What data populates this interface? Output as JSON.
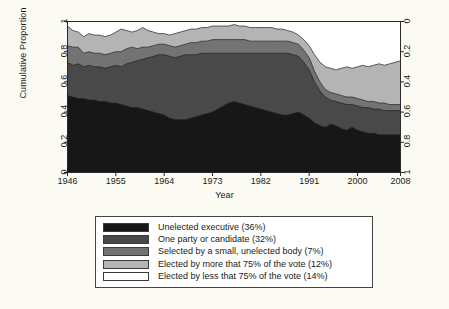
{
  "chart_data": {
    "type": "area",
    "title": "",
    "subtitle": "",
    "xlabel": "Year",
    "ylabel": "Cumulative Proportion",
    "ylabel_right": "",
    "xlim": [
      1946,
      2008
    ],
    "ylim": [
      0,
      1
    ],
    "xticks": [
      1946,
      1955,
      1964,
      1973,
      1982,
      1991,
      2000,
      2008
    ],
    "xtick_labels": [
      "1946",
      "1955",
      "1964",
      "1973",
      "1982",
      "1991",
      "2000",
      "2008"
    ],
    "yticks_left": [
      0,
      0.2,
      0.4,
      0.6,
      0.8,
      1
    ],
    "ytick_labels_left": [
      "0",
      "0.2",
      "0.4",
      "0.6",
      "0.8",
      "1"
    ],
    "yticks_right": [
      0,
      0.2,
      0.4,
      0.6,
      0.8,
      1
    ],
    "ytick_labels_right": [
      "0",
      "0.2",
      "0.4",
      "0.6",
      "0.8",
      "1"
    ],
    "right_axis_inverted": true,
    "grid": false,
    "legend_position": "below-plot",
    "stacked": true,
    "x": [
      1946,
      1947,
      1948,
      1949,
      1950,
      1951,
      1952,
      1953,
      1954,
      1955,
      1956,
      1957,
      1958,
      1959,
      1960,
      1961,
      1962,
      1963,
      1964,
      1965,
      1966,
      1967,
      1968,
      1969,
      1970,
      1971,
      1972,
      1973,
      1974,
      1975,
      1976,
      1977,
      1978,
      1979,
      1980,
      1981,
      1982,
      1983,
      1984,
      1985,
      1986,
      1987,
      1988,
      1989,
      1990,
      1991,
      1992,
      1993,
      1994,
      1995,
      1996,
      1997,
      1998,
      1999,
      2000,
      2001,
      2002,
      2003,
      2004,
      2005,
      2006,
      2007,
      2008
    ],
    "series": [
      {
        "name": "Unelected executive (36%)",
        "color": "#171717",
        "share_overall": 36,
        "cumulative_top": [
          0.51,
          0.5,
          0.49,
          0.49,
          0.48,
          0.48,
          0.47,
          0.47,
          0.46,
          0.46,
          0.45,
          0.44,
          0.43,
          0.43,
          0.42,
          0.41,
          0.4,
          0.39,
          0.38,
          0.36,
          0.35,
          0.35,
          0.35,
          0.36,
          0.37,
          0.38,
          0.39,
          0.4,
          0.42,
          0.44,
          0.46,
          0.47,
          0.46,
          0.45,
          0.44,
          0.43,
          0.42,
          0.41,
          0.4,
          0.39,
          0.38,
          0.38,
          0.39,
          0.4,
          0.38,
          0.36,
          0.33,
          0.31,
          0.3,
          0.32,
          0.31,
          0.29,
          0.28,
          0.3,
          0.28,
          0.27,
          0.26,
          0.26,
          0.25,
          0.25,
          0.25,
          0.25,
          0.25
        ]
      },
      {
        "name": "One party or candidate (32%)",
        "color": "#494949",
        "share_overall": 32,
        "cumulative_top": [
          0.73,
          0.71,
          0.72,
          0.7,
          0.71,
          0.7,
          0.7,
          0.69,
          0.7,
          0.71,
          0.7,
          0.72,
          0.73,
          0.74,
          0.75,
          0.76,
          0.77,
          0.78,
          0.78,
          0.77,
          0.76,
          0.77,
          0.78,
          0.78,
          0.78,
          0.79,
          0.79,
          0.79,
          0.79,
          0.79,
          0.79,
          0.79,
          0.79,
          0.79,
          0.79,
          0.79,
          0.79,
          0.79,
          0.79,
          0.79,
          0.79,
          0.79,
          0.78,
          0.77,
          0.73,
          0.68,
          0.6,
          0.54,
          0.5,
          0.48,
          0.47,
          0.46,
          0.45,
          0.45,
          0.44,
          0.43,
          0.43,
          0.42,
          0.42,
          0.41,
          0.41,
          0.41,
          0.41
        ]
      },
      {
        "name": "Selected by a small, unelected body (7%)",
        "color": "#737373",
        "share_overall": 7,
        "cumulative_top": [
          0.84,
          0.83,
          0.83,
          0.79,
          0.8,
          0.79,
          0.79,
          0.78,
          0.79,
          0.8,
          0.8,
          0.82,
          0.83,
          0.82,
          0.83,
          0.83,
          0.84,
          0.85,
          0.85,
          0.84,
          0.83,
          0.84,
          0.85,
          0.86,
          0.86,
          0.87,
          0.87,
          0.88,
          0.88,
          0.88,
          0.88,
          0.88,
          0.88,
          0.88,
          0.87,
          0.87,
          0.87,
          0.87,
          0.87,
          0.87,
          0.87,
          0.87,
          0.86,
          0.85,
          0.81,
          0.76,
          0.67,
          0.6,
          0.55,
          0.53,
          0.52,
          0.51,
          0.5,
          0.5,
          0.49,
          0.48,
          0.47,
          0.47,
          0.46,
          0.46,
          0.45,
          0.45,
          0.45
        ]
      },
      {
        "name": "Elected by more that 75% of the vote (12%)",
        "color": "#b4b4b4",
        "share_overall": 12,
        "cumulative_top": [
          0.97,
          0.94,
          0.93,
          0.9,
          0.92,
          0.91,
          0.91,
          0.9,
          0.91,
          0.93,
          0.95,
          0.94,
          0.93,
          0.94,
          0.96,
          0.94,
          0.93,
          0.92,
          0.92,
          0.91,
          0.92,
          0.93,
          0.94,
          0.95,
          0.95,
          0.96,
          0.96,
          0.97,
          0.97,
          0.97,
          0.97,
          0.98,
          0.97,
          0.97,
          0.96,
          0.96,
          0.96,
          0.96,
          0.96,
          0.95,
          0.95,
          0.94,
          0.93,
          0.91,
          0.88,
          0.84,
          0.78,
          0.73,
          0.7,
          0.69,
          0.68,
          0.69,
          0.7,
          0.69,
          0.7,
          0.71,
          0.7,
          0.71,
          0.72,
          0.71,
          0.72,
          0.73,
          0.74
        ]
      },
      {
        "name": "Elected by less that 75% of the vote (14%)",
        "color": "#ffffff",
        "share_overall": 14,
        "cumulative_top": [
          1,
          1,
          1,
          1,
          1,
          1,
          1,
          1,
          1,
          1,
          1,
          1,
          1,
          1,
          1,
          1,
          1,
          1,
          1,
          1,
          1,
          1,
          1,
          1,
          1,
          1,
          1,
          1,
          1,
          1,
          1,
          1,
          1,
          1,
          1,
          1,
          1,
          1,
          1,
          1,
          1,
          1,
          1,
          1,
          1,
          1,
          1,
          1,
          1,
          1,
          1,
          1,
          1,
          1,
          1,
          1,
          1,
          1,
          1,
          1,
          1,
          1,
          1
        ]
      }
    ]
  },
  "legend": {
    "items": [
      {
        "label": "Unelected executive (36%)",
        "color": "#171717"
      },
      {
        "label": "One party or candidate (32%)",
        "color": "#494949"
      },
      {
        "label": "Selected by a small, unelected body (7%)",
        "color": "#737373"
      },
      {
        "label": "Elected by more that 75% of the vote (12%)",
        "color": "#b4b4b4"
      },
      {
        "label": "Elected by less that 75% of the vote (14%)",
        "color": "#ffffff"
      }
    ]
  },
  "colors": {
    "background": "#fbfbf4",
    "plot_background": "#ffffff",
    "axis": "#2a2a2a",
    "text": "#1a1a1a"
  }
}
